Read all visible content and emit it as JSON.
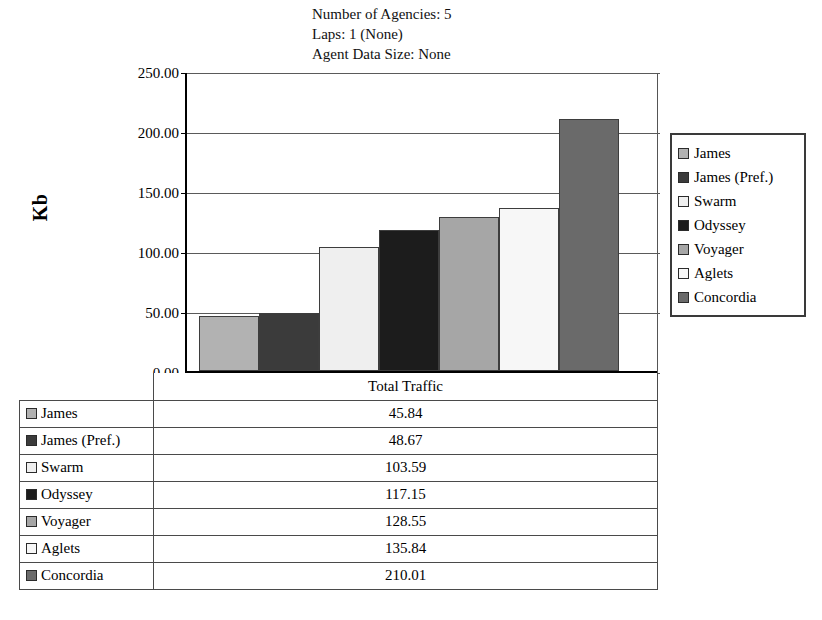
{
  "title_lines": [
    "Number of Agencies: 5",
    "Laps: 1 (None)",
    "Agent Data Size: None"
  ],
  "y_axis_title": "Kb",
  "table": {
    "header_label": "Total Traffic"
  },
  "legend": {
    "position": "right"
  },
  "chart_data": {
    "type": "bar",
    "xlabel": "",
    "ylabel": "Kb",
    "ylim": [
      0,
      250
    ],
    "ytick_labels": [
      "0.00",
      "50.00",
      "100.00",
      "150.00",
      "200.00",
      "250.00"
    ],
    "ytick_values": [
      0,
      50,
      100,
      150,
      200,
      250
    ],
    "grid": true,
    "legend_position": "right",
    "series_name": "Total Traffic",
    "categories": [
      "James",
      "James (Pref.)",
      "Swarm",
      "Odyssey",
      "Voyager",
      "Aglets",
      "Concordia"
    ],
    "values": [
      45.84,
      48.67,
      103.59,
      117.15,
      128.55,
      135.84,
      210.01
    ],
    "value_labels": [
      "45.84",
      "48.67",
      "103.59",
      "117.15",
      "128.55",
      "135.84",
      "210.01"
    ],
    "colors": [
      "#b2b2b2",
      "#3b3b3b",
      "#efefef",
      "#1c1c1c",
      "#a6a6a6",
      "#f7f7f7",
      "#6a6a6a"
    ]
  }
}
